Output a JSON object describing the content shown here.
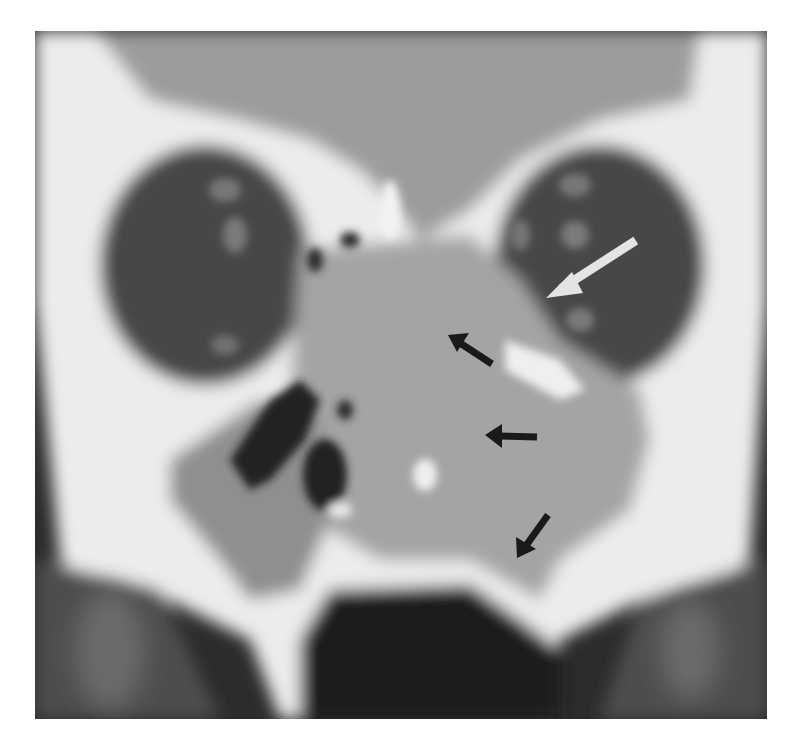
{
  "image": {
    "description": "Coronal CT scan of paranasal sinuses and orbits with soft-tissue mass",
    "colors": {
      "background": "#ffffff",
      "bone": "#f2f2f2",
      "soft_tissue": "#a8a8a8",
      "brain": "#9c9c9c",
      "orbit": "#4a4a4a",
      "air": "#202020",
      "white_arrow": "#e4e4e4",
      "black_arrow": "#1a1a1a"
    }
  },
  "annotations": [
    {
      "type": "arrow",
      "color": "white",
      "from": [
        632,
        243
      ],
      "to": [
        546,
        298
      ]
    },
    {
      "type": "arrow",
      "color": "black",
      "from": [
        492,
        364
      ],
      "to": [
        448,
        335
      ]
    },
    {
      "type": "arrow",
      "color": "black",
      "from": [
        537,
        437
      ],
      "to": [
        485,
        435
      ]
    },
    {
      "type": "arrow",
      "color": "black",
      "from": [
        548,
        515
      ],
      "to": [
        517,
        558
      ]
    }
  ]
}
